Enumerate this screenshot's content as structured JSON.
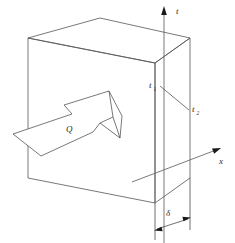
{
  "figure": {
    "type": "technical-diagram",
    "background_color": "#ffffff",
    "line_color": "#555555",
    "label_color": "#2b2b2b"
  },
  "axes": {
    "vertical": {
      "label": "t",
      "name": "temperature-axis",
      "direction": "up",
      "arrowhead": "filled"
    },
    "horizontal": {
      "label": "x",
      "name": "x-axis",
      "direction": "up-right",
      "arrowhead": "filled"
    }
  },
  "labels": {
    "heat_flow": {
      "symbol": "Q",
      "name": "heat-flow-arrow-label"
    },
    "temperature_hot": {
      "base": "t",
      "sub": "1",
      "name": "surface-temperature-1-label"
    },
    "temperature_cold": {
      "base": "t",
      "sub": "2",
      "name": "surface-temperature-2-label"
    },
    "thickness": {
      "symbol": "δ",
      "name": "thickness-dimension-label"
    }
  },
  "slab": {
    "name": "wall-slab",
    "description": "isometric rectangular plate",
    "front_face": [
      [
        28,
        38
      ],
      [
        155,
        63
      ],
      [
        155,
        203
      ],
      [
        28,
        178
      ]
    ],
    "top_face": [
      [
        28,
        38
      ],
      [
        100,
        18
      ],
      [
        190,
        38
      ],
      [
        155,
        63
      ]
    ],
    "right_face": [
      [
        155,
        63
      ],
      [
        190,
        38
      ],
      [
        190,
        178
      ],
      [
        155,
        203
      ]
    ]
  },
  "gradient_line": {
    "name": "temperature-gradient-line",
    "from": [
      158,
      85
    ],
    "to": [
      189,
      110
    ]
  },
  "heat_arrow": {
    "name": "heat-flow-block-arrow",
    "outline": [
      [
        12,
        133
      ],
      [
        76,
        112
      ],
      [
        69,
        105
      ],
      [
        110,
        92
      ],
      [
        122,
        116
      ],
      [
        121,
        137
      ],
      [
        101,
        123
      ],
      [
        92,
        131
      ],
      [
        42,
        155
      ]
    ]
  },
  "dimension": {
    "name": "thickness-dimension",
    "extension_left": [
      [
        155,
        203
      ],
      [
        155,
        240
      ]
    ],
    "extension_right": [
      [
        190,
        178
      ],
      [
        190,
        228
      ]
    ],
    "arrow_from": [
      157,
      228
    ],
    "arrow_to": [
      188,
      218
    ]
  }
}
